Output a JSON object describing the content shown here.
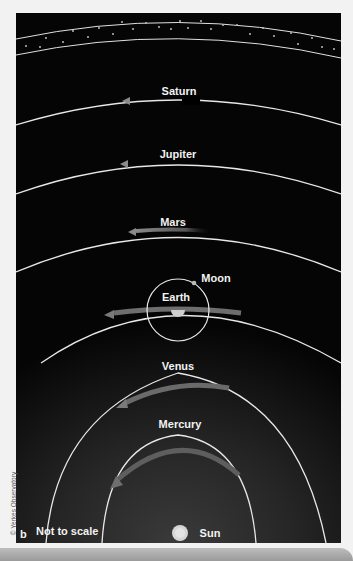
{
  "figure": {
    "panel_letter": "b",
    "note": "Not to scale",
    "credit": "© Yerkes Observatory"
  },
  "bodies": [
    {
      "name": "Saturn",
      "kind": "planet-orbit"
    },
    {
      "name": "Jupiter",
      "kind": "planet-orbit"
    },
    {
      "name": "Mars",
      "kind": "planet-orbit"
    },
    {
      "name": "Earth",
      "kind": "planet-orbit"
    },
    {
      "name": "Moon",
      "kind": "satellite-orbit"
    },
    {
      "name": "Venus",
      "kind": "planet-orbit"
    },
    {
      "name": "Mercury",
      "kind": "planet-orbit"
    },
    {
      "name": "Sun",
      "kind": "center"
    }
  ],
  "labels": {
    "saturn": "Saturn",
    "jupiter": "Jupiter",
    "mars": "Mars",
    "earth": "Earth",
    "moon": "Moon",
    "venus": "Venus",
    "mercury": "Mercury",
    "sun": "Sun"
  },
  "colors": {
    "background": "#000000",
    "orbit_line": "#e8e8e8",
    "motion_arrow": "#6a6a6a",
    "sun": "#cfcfcf",
    "star_band_dots": "#cccccc"
  }
}
